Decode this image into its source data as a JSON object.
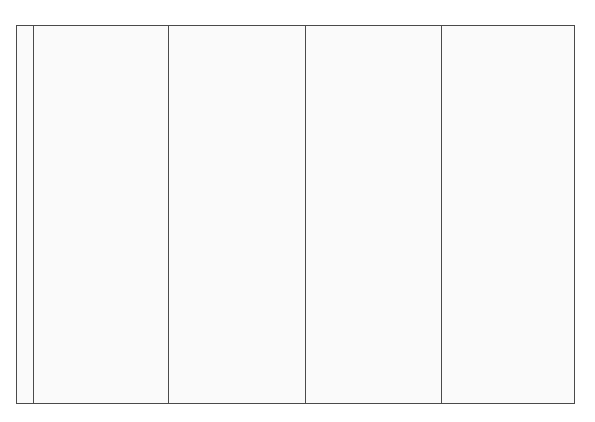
{
  "grid": {
    "columns": [
      {
        "label": ""
      },
      {
        "label": ""
      },
      {
        "label": ""
      },
      {
        "label": ""
      },
      {
        "label": ""
      }
    ],
    "line_color": "#4a4a4a",
    "fill_color": "#fafafa"
  }
}
